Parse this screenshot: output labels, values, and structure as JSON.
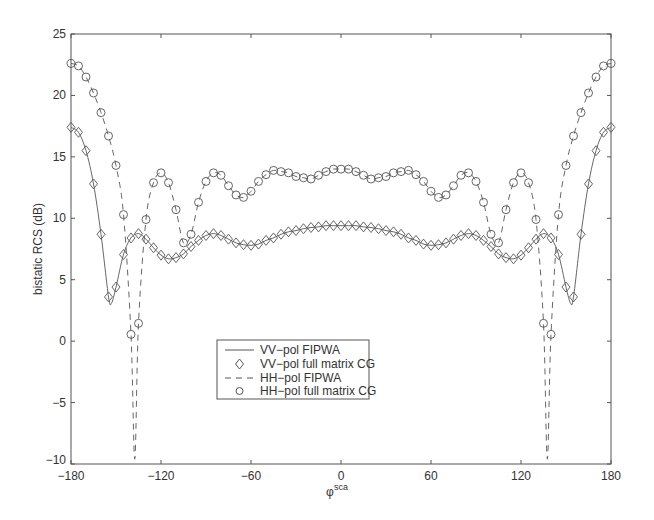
{
  "chart_data": {
    "type": "line",
    "title": "",
    "xlabel": "φ",
    "xlabel_superscript": "sca",
    "ylabel": "bistatic RCS (dB)",
    "xlim": [
      -180,
      180
    ],
    "ylim": [
      -10,
      25
    ],
    "xticks": [
      -180,
      -120,
      -60,
      0,
      60,
      120,
      180
    ],
    "yticks": [
      -10,
      -5,
      0,
      5,
      10,
      15,
      20,
      25
    ],
    "grid": false,
    "legend_position": "center-lower",
    "x_half": [
      -180,
      -175,
      -170,
      -165,
      -160,
      -155,
      -150,
      -145,
      -140,
      -135,
      -130,
      -125,
      -120,
      -115,
      -110,
      -105,
      -100,
      -95,
      -90,
      -85,
      -80,
      -75,
      -70,
      -65,
      -60,
      -55,
      -50,
      -45,
      -40,
      -35,
      -30,
      -25,
      -20,
      -15,
      -10,
      -5,
      0
    ],
    "symmetric_about_zero": true,
    "series": [
      {
        "name": "VV-pol FIPWA",
        "style": "solid-line",
        "values_half": [
          17.4,
          17.0,
          15.5,
          12.8,
          8.7,
          3.6,
          4.4,
          7.05,
          8.4,
          8.75,
          8.3,
          7.6,
          7.0,
          6.7,
          6.8,
          7.1,
          7.7,
          8.2,
          8.6,
          8.75,
          8.6,
          8.3,
          8.0,
          7.85,
          7.8,
          7.9,
          8.2,
          8.4,
          8.7,
          8.9,
          9.0,
          9.15,
          9.25,
          9.3,
          9.4,
          9.4,
          9.4
        ],
        "extra_points": [
          [
            -153,
            3.1
          ],
          [
            153,
            3.1
          ]
        ]
      },
      {
        "name": "VV-pol full matrix CG",
        "style": "diamond-markers",
        "values_half": [
          17.4,
          17.0,
          15.5,
          12.8,
          8.7,
          3.6,
          4.4,
          7.05,
          8.4,
          8.75,
          8.3,
          7.6,
          7.0,
          6.7,
          6.8,
          7.1,
          7.7,
          8.2,
          8.6,
          8.75,
          8.6,
          8.3,
          8.0,
          7.85,
          7.8,
          7.9,
          8.2,
          8.4,
          8.7,
          8.9,
          9.0,
          9.15,
          9.25,
          9.3,
          9.4,
          9.4,
          9.4
        ]
      },
      {
        "name": "HH-pol FIPWA",
        "style": "dashed-line",
        "values_half": [
          22.6,
          22.4,
          21.5,
          20.2,
          18.6,
          16.7,
          14.3,
          10.3,
          0.55,
          1.45,
          9.9,
          12.9,
          13.7,
          12.9,
          10.7,
          8.0,
          8.7,
          11.3,
          13.0,
          13.7,
          13.5,
          12.65,
          11.9,
          11.7,
          12.2,
          13.0,
          13.55,
          13.9,
          13.8,
          13.7,
          13.4,
          13.3,
          13.2,
          13.5,
          13.8,
          14.0,
          14.0
        ],
        "extra_points": [
          [
            -137.5,
            -9.6
          ],
          [
            137.5,
            -9.6
          ]
        ]
      },
      {
        "name": "HH-pol full matrix CG",
        "style": "circle-markers",
        "values_half": [
          22.6,
          22.4,
          21.5,
          20.2,
          18.6,
          16.7,
          14.3,
          10.3,
          0.55,
          1.45,
          9.9,
          12.9,
          13.7,
          12.9,
          10.7,
          8.0,
          8.7,
          11.3,
          13.0,
          13.7,
          13.5,
          12.65,
          11.9,
          11.7,
          12.2,
          13.0,
          13.55,
          13.9,
          13.8,
          13.7,
          13.4,
          13.3,
          13.2,
          13.5,
          13.8,
          14.0,
          14.0
        ]
      }
    ]
  },
  "legend": {
    "items": [
      {
        "label": "VV−pol FIPWA"
      },
      {
        "label": "VV−pol full matrix CG"
      },
      {
        "label": "HH−pol FIPWA"
      },
      {
        "label": "HH−pol full matrix CG"
      }
    ]
  },
  "axes": {
    "ylabel": "bistatic RCS (dB)",
    "xlabel_main": "φ",
    "xlabel_sup": "sca",
    "xtick_labels": [
      "−180",
      "−120",
      "−60",
      "0",
      "60",
      "120",
      "180"
    ],
    "ytick_labels": [
      "−10",
      "−5",
      "0",
      "5",
      "10",
      "15",
      "20",
      "25"
    ]
  },
  "colors": {
    "line": "#555555",
    "axis": "#444444",
    "text": "#333333",
    "background": "#ffffff"
  }
}
